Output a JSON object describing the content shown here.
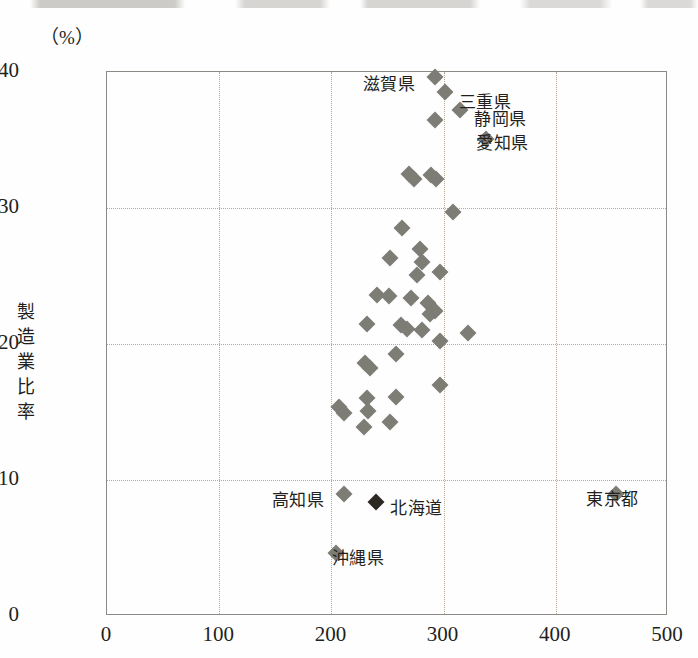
{
  "unit_label": "（%）",
  "axes": {
    "y_title": "製造業比率",
    "y_ticks": [
      0,
      10,
      20,
      30,
      40
    ],
    "y_min": 0,
    "y_max": 40,
    "x_ticks": [
      0,
      100,
      200,
      300,
      400,
      500
    ],
    "x_min": 0,
    "x_max": 500
  },
  "colors": {
    "marker": "#7d7d76",
    "marker_highlight": "#2b2824",
    "grid": "#b4a98e",
    "frame": "#8c8a84",
    "text": "#231f1c",
    "background": "#fefefe"
  },
  "chart_data": {
    "type": "scatter",
    "title": "",
    "xlabel": "",
    "ylabel": "製造業比率",
    "unit": "（%）",
    "xlim": [
      0,
      500
    ],
    "ylim": [
      0,
      40
    ],
    "xticks": [
      0,
      100,
      200,
      300,
      400,
      500
    ],
    "yticks": [
      0,
      10,
      20,
      30,
      40
    ],
    "grid": true,
    "legend": "none",
    "marker_shape": "diamond",
    "annotations": [
      {
        "text": "滋賀県",
        "x": 292,
        "y": 39.6,
        "label_dx": -72,
        "label_dy": -2
      },
      {
        "text": "三重県",
        "x": 301,
        "y": 38.5,
        "label_dx": 14,
        "label_dy": 1
      },
      {
        "text": "静岡県",
        "x": 315,
        "y": 37.2,
        "label_dx": 14,
        "label_dy": 0
      },
      {
        "text": "愛知県",
        "x": 338,
        "y": 35.1,
        "label_dx": -10,
        "label_dy": -5
      },
      {
        "text": "高知県",
        "x": 211,
        "y": 9.0,
        "label_dx": -72,
        "label_dy": -3
      },
      {
        "text": "北海道",
        "x": 240,
        "y": 8.4,
        "label_dx": 14,
        "label_dy": -3
      },
      {
        "text": "東京都",
        "x": 454,
        "y": 9.0,
        "label_dx": -30,
        "label_dy": -4
      },
      {
        "text": "沖縄県",
        "x": 204,
        "y": 4.6,
        "label_dx": -4,
        "label_dy": -4
      }
    ],
    "points": [
      {
        "x": 292,
        "y": 39.6,
        "label": "滋賀県"
      },
      {
        "x": 301,
        "y": 38.5,
        "label": "三重県"
      },
      {
        "x": 315,
        "y": 37.2,
        "label": "静岡県"
      },
      {
        "x": 292,
        "y": 36.5,
        "label": ""
      },
      {
        "x": 338,
        "y": 35.1,
        "label": "愛知県"
      },
      {
        "x": 269,
        "y": 32.5,
        "label": ""
      },
      {
        "x": 274,
        "y": 32.1,
        "label": ""
      },
      {
        "x": 289,
        "y": 32.4,
        "label": ""
      },
      {
        "x": 293,
        "y": 32.1,
        "label": ""
      },
      {
        "x": 308,
        "y": 29.7,
        "label": ""
      },
      {
        "x": 263,
        "y": 28.5,
        "label": ""
      },
      {
        "x": 252,
        "y": 26.3,
        "label": ""
      },
      {
        "x": 279,
        "y": 27.0,
        "label": ""
      },
      {
        "x": 281,
        "y": 26.0,
        "label": ""
      },
      {
        "x": 276,
        "y": 25.1,
        "label": ""
      },
      {
        "x": 297,
        "y": 25.3,
        "label": ""
      },
      {
        "x": 241,
        "y": 23.6,
        "label": ""
      },
      {
        "x": 251,
        "y": 23.5,
        "label": ""
      },
      {
        "x": 271,
        "y": 23.4,
        "label": ""
      },
      {
        "x": 286,
        "y": 23.0,
        "label": ""
      },
      {
        "x": 288,
        "y": 22.2,
        "label": ""
      },
      {
        "x": 292,
        "y": 22.4,
        "label": ""
      },
      {
        "x": 232,
        "y": 21.5,
        "label": ""
      },
      {
        "x": 262,
        "y": 21.4,
        "label": ""
      },
      {
        "x": 267,
        "y": 21.1,
        "label": ""
      },
      {
        "x": 281,
        "y": 21.0,
        "label": ""
      },
      {
        "x": 322,
        "y": 20.8,
        "label": ""
      },
      {
        "x": 297,
        "y": 20.2,
        "label": ""
      },
      {
        "x": 230,
        "y": 18.6,
        "label": ""
      },
      {
        "x": 234,
        "y": 18.2,
        "label": ""
      },
      {
        "x": 258,
        "y": 19.3,
        "label": ""
      },
      {
        "x": 297,
        "y": 17.0,
        "label": ""
      },
      {
        "x": 207,
        "y": 15.4,
        "label": ""
      },
      {
        "x": 211,
        "y": 14.9,
        "label": ""
      },
      {
        "x": 232,
        "y": 16.0,
        "label": ""
      },
      {
        "x": 233,
        "y": 15.1,
        "label": ""
      },
      {
        "x": 258,
        "y": 16.1,
        "label": ""
      },
      {
        "x": 229,
        "y": 13.9,
        "label": ""
      },
      {
        "x": 252,
        "y": 14.3,
        "label": ""
      },
      {
        "x": 211,
        "y": 9.0,
        "label": "高知県"
      },
      {
        "x": 240,
        "y": 8.4,
        "label": "北海道",
        "highlight": true
      },
      {
        "x": 454,
        "y": 9.0,
        "label": "東京都"
      },
      {
        "x": 204,
        "y": 4.6,
        "label": "沖縄県"
      }
    ]
  }
}
